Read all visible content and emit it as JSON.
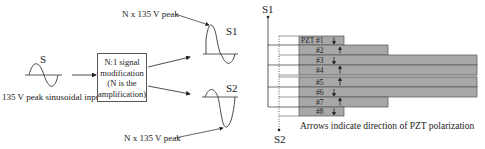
{
  "input": {
    "label": "S",
    "caption": "135 V peak sinusoidal input"
  },
  "modifier_box": {
    "lines": [
      "N:1 signal",
      "modification",
      "(N is the",
      "amplification)"
    ]
  },
  "outputs": {
    "s1": {
      "label": "S1",
      "annotation": "N x 135 V peak"
    },
    "s2": {
      "label": "S2",
      "annotation": "N x 135 V peak"
    }
  },
  "stack": {
    "terminal_top": "S1",
    "terminal_bottom": "S2",
    "caption": "Arrows indicate direction of PZT polarization",
    "fill_color": "#a8a8a8",
    "layers": [
      {
        "label": "PZT #1",
        "arrow": "down"
      },
      {
        "label": "#2",
        "arrow": "up"
      },
      {
        "label": "#3",
        "arrow": "down"
      },
      {
        "label": "#4",
        "arrow": "up"
      },
      {
        "label": "#5",
        "arrow": "up"
      },
      {
        "label": "#6",
        "arrow": "down"
      },
      {
        "label": "#7",
        "arrow": "up"
      },
      {
        "label": "#8",
        "arrow": "down"
      }
    ]
  }
}
